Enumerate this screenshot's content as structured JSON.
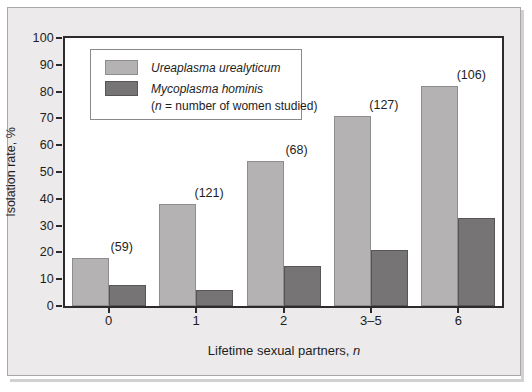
{
  "chart_data": {
    "type": "bar",
    "title": "",
    "xlabel": "Lifetime sexual partners, n",
    "ylabel": "Isolation rate, %",
    "categories": [
      "0",
      "1",
      "2",
      "3–5",
      "6"
    ],
    "ylim": [
      0,
      100
    ],
    "yticks": [
      "0",
      "10",
      "20",
      "30",
      "40",
      "50",
      "60",
      "70",
      "80",
      "90",
      "100"
    ],
    "grid": false,
    "legend_position": "upper-left-inside",
    "series": [
      {
        "name": "Ureaplasma urealyticum",
        "color": "#b4b2b2",
        "values": [
          18,
          38,
          54,
          71,
          82
        ]
      },
      {
        "name": "Mycoplasma hominis",
        "color": "#767474",
        "values": [
          8,
          6,
          15,
          21,
          33
        ]
      }
    ],
    "annotations": [
      "(59)",
      "(121)",
      "(68)",
      "(127)",
      "(106)"
    ],
    "legend_note": "(n = number of women studied)",
    "note_italic_token": "n"
  },
  "axis": {
    "y_title": "Isolation rate, %",
    "x_title_main": "Lifetime sexual partners, ",
    "x_title_italic": "n"
  },
  "legend": {
    "note_prefix": "(",
    "note_italic": "n",
    "note_suffix": " = number of women studied)"
  },
  "colors": {
    "series_light": "#b4b2b2",
    "series_dark": "#767474",
    "frame": "#2c2c2c",
    "panel_background": "#eceaea",
    "plot_background": "#ffffff",
    "text": "#1d1d1d"
  }
}
